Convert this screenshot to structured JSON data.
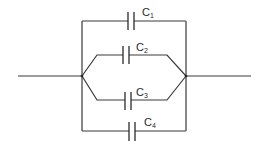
{
  "diagram": {
    "type": "circuit",
    "capacitors": [
      {
        "id": "C1",
        "prefix": "C",
        "sub": "1",
        "branch": "top"
      },
      {
        "id": "C2",
        "prefix": "C",
        "sub": "2",
        "branch": "upper-middle"
      },
      {
        "id": "C3",
        "prefix": "C",
        "sub": "3",
        "branch": "lower-middle"
      },
      {
        "id": "C4",
        "prefix": "C",
        "sub": "4",
        "branch": "bottom"
      }
    ],
    "colors": {
      "line": "#3a3a3a",
      "background": "#ffffff"
    }
  }
}
